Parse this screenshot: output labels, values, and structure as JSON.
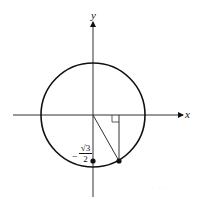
{
  "diagram": {
    "type": "unit-circle",
    "axes": {
      "x_label": "x",
      "y_label": "y"
    },
    "circle": {
      "center": [
        93,
        115
      ],
      "radius": 52,
      "stroke": "#111111"
    },
    "point_on_circle": {
      "x": 119,
      "y": 161
    },
    "axis_point": {
      "x": 93,
      "y": 161
    },
    "axis_point_label": {
      "sign": "−",
      "numerator": "√3",
      "denominator": "2"
    },
    "right_angle_marker": true,
    "watermark": "· · · · · · · · ·"
  }
}
